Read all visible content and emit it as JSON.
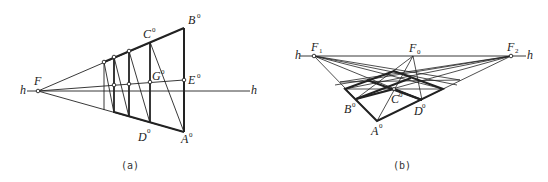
{
  "figure_a": {
    "caption": "(a)",
    "labels": {
      "h_left": "h",
      "h_right": "h",
      "F": "F",
      "B": "B",
      "C": "C",
      "E": "E",
      "G": "G",
      "D": "D",
      "A": "A",
      "superscript": "0"
    }
  },
  "figure_b": {
    "caption": "(b)",
    "labels": {
      "h_left": "h",
      "h_right": "h",
      "F1": "F",
      "F1_sub": "1",
      "F0": "F",
      "F0_sub": "0",
      "F2": "F",
      "F2_sub": "2",
      "A": "A",
      "B": "B",
      "C": "C",
      "D": "D",
      "superscript": "0"
    }
  },
  "colors": {
    "line": "#222222",
    "background": "#ffffff"
  }
}
